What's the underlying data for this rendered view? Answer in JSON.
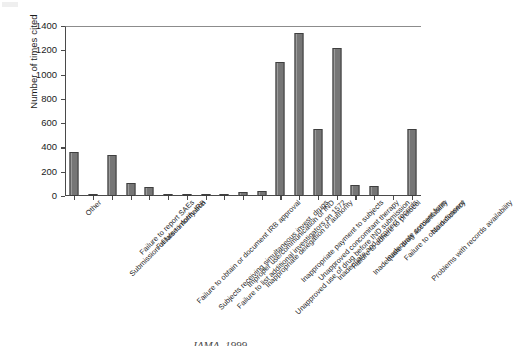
{
  "chart_data": {
    "type": "bar",
    "title": "",
    "xlabel": "",
    "ylabel": "Number of times cited",
    "ylim": [
      0,
      1400
    ],
    "ytick_step": 200,
    "yticks": [
      0,
      200,
      400,
      600,
      800,
      1000,
      1200,
      1400
    ],
    "grid": false,
    "legend": false,
    "bar_color": "#767676",
    "bar_edge_color": "#3f3f3f",
    "categories": [
      "Other",
      "Submission of false information",
      "Failure to report SAEs",
      "Failure to notify IRB",
      "Failure to obtain or document IRB approval",
      "Subjects receiving simultaneous invest. drugs",
      "Failure to list additional investigators on 1572",
      "Improper use/communication of IND",
      "Inappropriate delegation of authority",
      "Unapproved use of drug before IND submission",
      "Inappropriate payment to subjects",
      "Unapproved concomitant therapy",
      "Inadequate and incorrect records",
      "Failure to adhere to protocol",
      "Inadequate drug accountability",
      "Inadequate consent form",
      "Failure to obtain consent",
      "Problems with records availability",
      "No deficiency"
    ],
    "values": [
      360,
      20,
      335,
      110,
      75,
      10,
      20,
      15,
      20,
      30,
      45,
      1100,
      1340,
      550,
      1220,
      90,
      85,
      0,
      550
    ]
  },
  "axis": {
    "y_title": "Number of times cited"
  },
  "caption": {
    "text": "JAMA. 1999"
  },
  "icons": {
    "corner_speck": "page-scan-artifact"
  }
}
